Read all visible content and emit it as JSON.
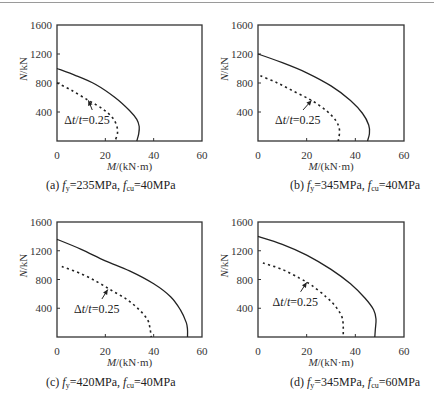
{
  "figure": {
    "bottom_caption_visible": "faint, cut-off figure caption line"
  },
  "chart_data": [
    {
      "id": "a",
      "type": "line",
      "title": "",
      "caption": {
        "prefix": "(a)",
        "fy": "=235MPa",
        "fcu": "=40MPa"
      },
      "xlabel": "M/(kN·m)",
      "ylabel": "N/kN",
      "xlim": [
        0,
        60
      ],
      "ylim": [
        0,
        1600
      ],
      "xticks": [
        "0",
        "20",
        "40",
        "60"
      ],
      "yticks": [
        "400",
        "800",
        "1200",
        "1600"
      ],
      "grid": false,
      "annotation": {
        "text": "Δt/t=0.25",
        "arrow_to": [
          13,
          560
        ],
        "text_at": [
          3,
          290
        ]
      },
      "series": [
        {
          "name": "intact",
          "style": "solid",
          "points": [
            [
              0,
              1000
            ],
            [
              8,
              900
            ],
            [
              16,
              780
            ],
            [
              24,
              600
            ],
            [
              30,
              420
            ],
            [
              33,
              300
            ],
            [
              34,
              200
            ],
            [
              33.8,
              100
            ],
            [
              33,
              0
            ]
          ]
        },
        {
          "name": "Δt/t=0.25",
          "style": "dashed",
          "points": [
            [
              0,
              800
            ],
            [
              6,
              700
            ],
            [
              13,
              560
            ],
            [
              19,
              440
            ],
            [
              23,
              320
            ],
            [
              24.8,
              200
            ],
            [
              25,
              100
            ],
            [
              24,
              0
            ]
          ]
        }
      ]
    },
    {
      "id": "b",
      "type": "line",
      "title": "",
      "caption": {
        "prefix": "(b)",
        "fy": "=345MPa",
        "fcu": "=40MPa"
      },
      "xlabel": "M/(kN·m)",
      "ylabel": "N/kN",
      "xlim": [
        0,
        60
      ],
      "ylim": [
        0,
        1600
      ],
      "xticks": [
        "0",
        "20",
        "40",
        "60"
      ],
      "yticks": [
        "400",
        "800",
        "1200",
        "1600"
      ],
      "grid": false,
      "annotation": {
        "text": "Δt/t=0.25",
        "arrow_to": [
          22,
          560
        ],
        "text_at": [
          7,
          290
        ]
      },
      "series": [
        {
          "name": "intact",
          "style": "solid",
          "points": [
            [
              0,
              1200
            ],
            [
              10,
              1080
            ],
            [
              20,
              940
            ],
            [
              30,
              760
            ],
            [
              38,
              560
            ],
            [
              43,
              380
            ],
            [
              45.5,
              220
            ],
            [
              45.8,
              100
            ],
            [
              45,
              0
            ]
          ]
        },
        {
          "name": "Δt/t=0.25",
          "style": "dashed",
          "points": [
            [
              1,
              900
            ],
            [
              8,
              800
            ],
            [
              15,
              680
            ],
            [
              22,
              560
            ],
            [
              28,
              420
            ],
            [
              32,
              280
            ],
            [
              33.5,
              150
            ],
            [
              33,
              0
            ]
          ]
        }
      ]
    },
    {
      "id": "c",
      "type": "line",
      "title": "",
      "caption": {
        "prefix": "(c)",
        "fy": "=420MPa",
        "fcu": "=40MPa"
      },
      "xlabel": "M/(kN·m)",
      "ylabel": "N/kN",
      "xlim": [
        0,
        60
      ],
      "ylim": [
        0,
        1600
      ],
      "xticks": [
        "0",
        "20",
        "40",
        "60"
      ],
      "yticks": [
        "400",
        "800",
        "1200",
        "1600"
      ],
      "grid": false,
      "annotation": {
        "text": "Δt/t=0.25",
        "arrow_to": [
          21,
          660
        ],
        "text_at": [
          7,
          390
        ]
      },
      "series": [
        {
          "name": "intact",
          "style": "solid",
          "points": [
            [
              0,
              1360
            ],
            [
              10,
              1220
            ],
            [
              20,
              1060
            ],
            [
              30,
              920
            ],
            [
              40,
              740
            ],
            [
              47,
              560
            ],
            [
              51,
              380
            ],
            [
              53.5,
              200
            ],
            [
              54,
              100
            ],
            [
              54,
              0
            ]
          ]
        },
        {
          "name": "Δt/t=0.25",
          "style": "dashed",
          "points": [
            [
              2,
              980
            ],
            [
              10,
              880
            ],
            [
              17,
              760
            ],
            [
              23,
              640
            ],
            [
              29,
              520
            ],
            [
              34,
              380
            ],
            [
              37.5,
              240
            ],
            [
              38.5,
              120
            ],
            [
              39,
              0
            ]
          ]
        }
      ]
    },
    {
      "id": "d",
      "type": "line",
      "title": "",
      "caption": {
        "prefix": "(d)",
        "fy": "=345MPa",
        "fcu": "=60MPa"
      },
      "xlabel": "M/(kN·m)",
      "ylabel": "N/kN",
      "xlim": [
        0,
        60
      ],
      "ylim": [
        0,
        1600
      ],
      "xticks": [
        "0",
        "20",
        "40",
        "60"
      ],
      "yticks": [
        "400",
        "800",
        "1200",
        "1600"
      ],
      "grid": false,
      "annotation": {
        "text": "Δt/t=0.25",
        "arrow_to": [
          20,
          760
        ],
        "text_at": [
          6,
          490
        ]
      },
      "series": [
        {
          "name": "intact",
          "style": "solid",
          "points": [
            [
              0,
              1400
            ],
            [
              10,
              1290
            ],
            [
              20,
              1140
            ],
            [
              30,
              940
            ],
            [
              38,
              740
            ],
            [
              44,
              540
            ],
            [
              47.5,
              380
            ],
            [
              48.5,
              250
            ],
            [
              48.2,
              100
            ],
            [
              48,
              0
            ]
          ]
        },
        {
          "name": "Δt/t=0.25",
          "style": "dashed",
          "points": [
            [
              2,
              1030
            ],
            [
              10,
              940
            ],
            [
              17,
              820
            ],
            [
              22,
              720
            ],
            [
              28,
              560
            ],
            [
              32,
              420
            ],
            [
              34.5,
              280
            ],
            [
              35,
              150
            ],
            [
              35,
              0
            ]
          ]
        }
      ]
    }
  ]
}
